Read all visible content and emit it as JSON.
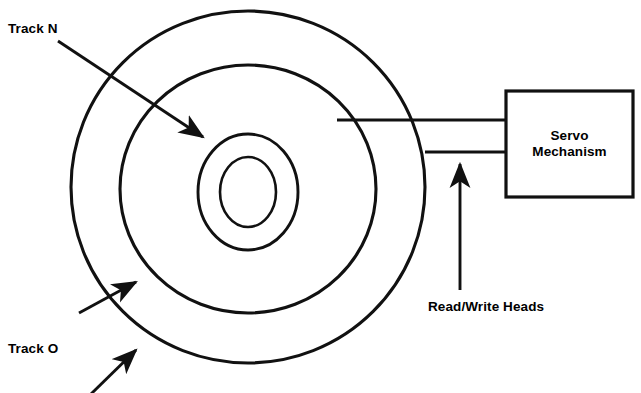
{
  "diagram": {
    "background_color": "#ffffff",
    "stroke_color": "#000000",
    "canvas": {
      "width": 641,
      "height": 393
    }
  },
  "labels": {
    "track_n": "Track N",
    "track_o": "Track O",
    "read_write_heads": "Read/Write Heads",
    "servo_line_1": "Servo",
    "servo_line_2": "Mechanism"
  },
  "shapes": {
    "platter_rings": [
      {
        "name": "outer-track-ring",
        "cx": 248,
        "cy": 187,
        "rx": 177,
        "ry": 176
      },
      {
        "name": "middle-track-ring",
        "cx": 248,
        "cy": 189,
        "rx": 128,
        "ry": 124
      },
      {
        "name": "inner-track-ring",
        "cx": 248,
        "cy": 192,
        "rx": 50,
        "ry": 58
      },
      {
        "name": "spindle-hole-ring",
        "cx": 248,
        "cy": 192,
        "rx": 28,
        "ry": 35
      }
    ],
    "servo_box": {
      "x": 506,
      "y": 91,
      "width": 127,
      "height": 106
    },
    "actuator_arm_upper": {
      "x1": 337,
      "y1": 120,
      "x2": 506,
      "y2": 120
    },
    "actuator_arm_lower": {
      "x1": 425,
      "y1": 152,
      "x2": 506,
      "y2": 152
    }
  },
  "arrows": [
    {
      "name": "track-n-arrow",
      "x1": 58,
      "y1": 41,
      "x2": 208,
      "y2": 141
    },
    {
      "name": "track-o-upper-arrow",
      "x1": 79,
      "y1": 313,
      "x2": 141,
      "y2": 279
    },
    {
      "name": "track-o-lower-arrow",
      "x1": 91,
      "y1": 393,
      "x2": 141,
      "y2": 346
    },
    {
      "name": "read-write-heads-arrow",
      "x1": 460,
      "y1": 290,
      "x2": 460,
      "y2": 159
    }
  ]
}
